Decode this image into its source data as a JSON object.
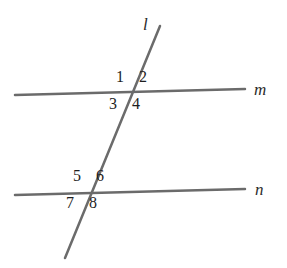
{
  "figure": {
    "width": 287,
    "height": 268,
    "background_color": "#ffffff",
    "line_color": "#6b6b6b",
    "label_color": "#1e1e1e",
    "line_width": 2.5
  },
  "lines": [
    {
      "id": "m",
      "label": "m",
      "role": "parallel-line-upper",
      "x1": 15,
      "y1": 95,
      "x2": 245,
      "y2": 89,
      "label_x": 254,
      "label_y": 81
    },
    {
      "id": "n",
      "label": "n",
      "role": "parallel-line-lower",
      "x1": 15,
      "y1": 195,
      "x2": 245,
      "y2": 189,
      "label_x": 255,
      "label_y": 181
    },
    {
      "id": "l",
      "label": "l",
      "role": "transversal",
      "x1": 160,
      "y1": 26,
      "x2": 65,
      "y2": 258,
      "label_x": 143,
      "label_y": 16
    }
  ],
  "intersections": [
    {
      "id": "upper",
      "lines": "l-and-m",
      "x": 131,
      "y": 93
    },
    {
      "id": "lower",
      "lines": "l-and-n",
      "x": 88,
      "y": 192
    }
  ],
  "angles": [
    {
      "number": "1",
      "intersection": "upper",
      "position": "upper-left",
      "x": 116,
      "y": 69
    },
    {
      "number": "2",
      "intersection": "upper",
      "position": "upper-right",
      "x": 139,
      "y": 69
    },
    {
      "number": "3",
      "intersection": "upper",
      "position": "lower-left",
      "x": 109,
      "y": 96
    },
    {
      "number": "4",
      "intersection": "upper",
      "position": "lower-right",
      "x": 132,
      "y": 96
    },
    {
      "number": "5",
      "intersection": "lower",
      "position": "upper-left",
      "x": 73,
      "y": 168
    },
    {
      "number": "6",
      "intersection": "lower",
      "position": "upper-right",
      "x": 96,
      "y": 168
    },
    {
      "number": "7",
      "intersection": "lower",
      "position": "lower-left",
      "x": 66,
      "y": 195
    },
    {
      "number": "8",
      "intersection": "lower",
      "position": "lower-right",
      "x": 89,
      "y": 195
    }
  ]
}
